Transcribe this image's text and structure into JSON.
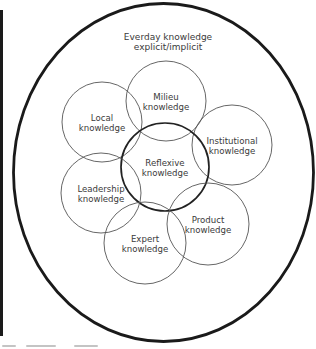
{
  "diagram": {
    "outer": {
      "title_line1": "Everday knowledge",
      "title_line2": "explicit/implicit",
      "cx": 163.5,
      "cy": 172.5,
      "rx": 150,
      "ry": 169,
      "stroke": "#1a1a1a",
      "stroke_width": 2.8
    },
    "circles": [
      {
        "id": "milieu",
        "line1": "Milieu",
        "line2": "knowledge",
        "cx": 166,
        "cy": 101,
        "r": 40
      },
      {
        "id": "local",
        "line1": "Local",
        "line2": "knowledge",
        "cx": 102,
        "cy": 122,
        "r": 40
      },
      {
        "id": "institutional",
        "line1": "Institutional",
        "line2": "knowledge",
        "cx": 232,
        "cy": 145,
        "r": 40
      },
      {
        "id": "reflexive",
        "line1": "Reflexive",
        "line2": "knowledge",
        "cx": 165,
        "cy": 167,
        "r": 44,
        "emphasis": true
      },
      {
        "id": "leadership",
        "line1": "Leadership",
        "line2": "knowledge",
        "cx": 101,
        "cy": 193,
        "r": 40
      },
      {
        "id": "product",
        "line1": "Product",
        "line2": "knowledge",
        "cx": 208,
        "cy": 224,
        "r": 41
      },
      {
        "id": "expert",
        "line1": "Expert",
        "line2": "knowledge",
        "cx": 145,
        "cy": 243,
        "r": 41
      }
    ],
    "colors": {
      "circle_stroke": "#555555",
      "emphasis_stroke": "#222222",
      "text": "#3a3a3a"
    }
  }
}
